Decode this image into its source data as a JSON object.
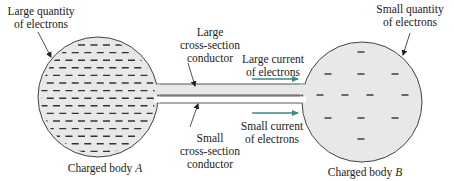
{
  "diagram": {
    "colors": {
      "body_fill": "#e6e9e8",
      "outline": "#444444",
      "dash": "#333333",
      "arrow": "#3a8a8a",
      "leader": "#222222",
      "small_conductor_fill": "#ffffff",
      "large_conductor_fill": "#e6e9e8"
    },
    "body_a": {
      "label": "Charged body ",
      "label_var": "A",
      "annotation_line1": "Large quantity",
      "annotation_line2": "of electrons",
      "cx": 98,
      "cy": 97,
      "r": 60,
      "dash_rows": 15,
      "dash_row_start_y": 45,
      "dash_row_spacing": 7.6,
      "dash_col_spacing": 12.5,
      "dash_length": 7
    },
    "body_b": {
      "label": "Charged body ",
      "label_var": "B",
      "annotation_line1": "Small quantity",
      "annotation_line2": "of electrons",
      "cx": 362,
      "cy": 102,
      "r": 60,
      "dashes": [
        [
          361,
          52
        ],
        [
          328,
          74
        ],
        [
          361,
          74
        ],
        [
          395,
          74
        ],
        [
          320,
          95
        ],
        [
          345,
          95
        ],
        [
          370,
          95
        ],
        [
          405,
          95
        ],
        [
          328,
          118
        ],
        [
          361,
          118
        ],
        [
          395,
          118
        ],
        [
          361,
          139
        ]
      ]
    },
    "large_conductor": {
      "label_line1": "Large",
      "label_line2": "cross-section",
      "label_line3": "conductor",
      "x1": 156,
      "x2": 304,
      "y": 84,
      "h": 11
    },
    "small_conductor": {
      "label_line1": "Small",
      "label_line2": "cross-section",
      "label_line3": "conductor",
      "x1": 156,
      "x2": 304,
      "y": 96,
      "h": 7
    },
    "large_current": {
      "label_line1": "Large current",
      "label_line2": "of electrons",
      "arrow_x1": 252,
      "arrow_x2": 298,
      "arrow_y": 79
    },
    "small_current": {
      "label_line1": "Small current",
      "label_line2": "of electrons",
      "arrow_x1": 252,
      "arrow_x2": 298,
      "arrow_y": 113
    }
  }
}
